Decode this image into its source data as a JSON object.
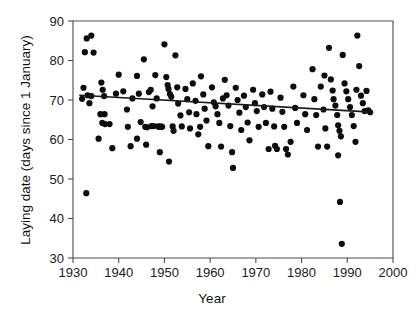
{
  "chart_data": {
    "type": "scatter",
    "title": "",
    "xlabel": "Year",
    "ylabel": "Laying date (days since 1 January)",
    "xlim": [
      1930,
      2000
    ],
    "ylim": [
      30,
      90
    ],
    "xticks": [
      1930,
      1940,
      1950,
      1960,
      1970,
      1980,
      1990,
      2000
    ],
    "xtick_labels": [
      "1930",
      "1940",
      "1950",
      "1960",
      "1970",
      "1980",
      "1990",
      "2000"
    ],
    "yticks": [
      30,
      40,
      50,
      60,
      70,
      80,
      90
    ],
    "ytick_labels": [
      "30",
      "40",
      "50",
      "60",
      "70",
      "80",
      "90"
    ],
    "grid": false,
    "legend": null,
    "marker": {
      "shape": "circle",
      "color": "#0d0d0d",
      "size": 3.1
    },
    "trend_line": {
      "type": "linear-regression",
      "color": "#1a1a1a",
      "x_start": 1931.5,
      "y_start": 71.2,
      "x_end": 1994.5,
      "y_end": 67.0
    },
    "points": [
      [
        1933.0,
        85.6
      ],
      [
        1934.0,
        86.3
      ],
      [
        1932.6,
        82.1
      ],
      [
        1934.5,
        82.0
      ],
      [
        1932.3,
        73.1
      ],
      [
        1933.2,
        71.2
      ],
      [
        1934.0,
        71.0
      ],
      [
        1932.0,
        70.3
      ],
      [
        1933.6,
        69.2
      ],
      [
        1932.9,
        46.4
      ],
      [
        1936.2,
        74.4
      ],
      [
        1936.5,
        72.6
      ],
      [
        1936.8,
        71.0
      ],
      [
        1936.0,
        66.4
      ],
      [
        1936.9,
        66.4
      ],
      [
        1936.4,
        64.2
      ],
      [
        1937.0,
        63.9
      ],
      [
        1935.6,
        60.2
      ],
      [
        1938.6,
        57.8
      ],
      [
        1939.4,
        71.6
      ],
      [
        1940.0,
        76.4
      ],
      [
        1941.8,
        67.6
      ],
      [
        1942.0,
        63.2
      ],
      [
        1942.6,
        58.3
      ],
      [
        1944.0,
        76.1
      ],
      [
        1944.4,
        71.6
      ],
      [
        1944.8,
        64.4
      ],
      [
        1944.0,
        60.2
      ],
      [
        1945.5,
        80.3
      ],
      [
        1945.8,
        63.2
      ],
      [
        1946.2,
        63.1
      ],
      [
        1946.0,
        58.7
      ],
      [
        1947.0,
        72.6
      ],
      [
        1947.4,
        68.4
      ],
      [
        1947.6,
        63.4
      ],
      [
        1947.2,
        63.4
      ],
      [
        1948.0,
        76.3
      ],
      [
        1948.3,
        70.4
      ],
      [
        1948.6,
        63.3
      ],
      [
        1948.9,
        63.2
      ],
      [
        1949.2,
        63.3
      ],
      [
        1949.5,
        63.2
      ],
      [
        1949.0,
        56.8
      ],
      [
        1950.0,
        84.1
      ],
      [
        1950.4,
        75.8
      ],
      [
        1950.7,
        73.8
      ],
      [
        1950.9,
        72.8
      ],
      [
        1951.2,
        71.5
      ],
      [
        1951.5,
        70.8
      ],
      [
        1951.8,
        63.3
      ],
      [
        1951.0,
        54.4
      ],
      [
        1952.4,
        81.3
      ],
      [
        1952.8,
        73.2
      ],
      [
        1953.0,
        69.1
      ],
      [
        1953.5,
        66.1
      ],
      [
        1953.8,
        63.3
      ],
      [
        1954.6,
        72.8
      ],
      [
        1955.0,
        70.2
      ],
      [
        1955.4,
        66.9
      ],
      [
        1955.6,
        62.8
      ],
      [
        1956.2,
        74.2
      ],
      [
        1956.8,
        69.8
      ],
      [
        1957.0,
        66.4
      ],
      [
        1957.4,
        61.3
      ],
      [
        1958.0,
        76.0
      ],
      [
        1958.5,
        71.4
      ],
      [
        1958.8,
        67.8
      ],
      [
        1959.2,
        64.8
      ],
      [
        1959.6,
        58.3
      ],
      [
        1960.4,
        73.2
      ],
      [
        1960.8,
        69.4
      ],
      [
        1961.2,
        68.4
      ],
      [
        1961.6,
        66.4
      ],
      [
        1962.0,
        64.2
      ],
      [
        1962.4,
        58.2
      ],
      [
        1963.2,
        75.1
      ],
      [
        1963.6,
        71.2
      ],
      [
        1964.0,
        68.6
      ],
      [
        1964.4,
        63.4
      ],
      [
        1964.8,
        56.8
      ],
      [
        1965.6,
        73.1
      ],
      [
        1966.0,
        70.0
      ],
      [
        1966.4,
        66.8
      ],
      [
        1966.8,
        62.4
      ],
      [
        1967.4,
        71.1
      ],
      [
        1967.8,
        68.2
      ],
      [
        1968.2,
        64.3
      ],
      [
        1968.6,
        59.8
      ],
      [
        1969.4,
        72.6
      ],
      [
        1969.8,
        69.2
      ],
      [
        1970.2,
        67.2
      ],
      [
        1970.6,
        63.2
      ],
      [
        1971.4,
        71.4
      ],
      [
        1971.8,
        68.2
      ],
      [
        1972.2,
        64.2
      ],
      [
        1973.2,
        72.1
      ],
      [
        1973.6,
        67.8
      ],
      [
        1974.0,
        63.3
      ],
      [
        1974.2,
        58.4
      ],
      [
        1974.6,
        57.6
      ],
      [
        1975.4,
        70.6
      ],
      [
        1975.8,
        67.0
      ],
      [
        1976.2,
        63.2
      ],
      [
        1976.6,
        57.6
      ],
      [
        1977.0,
        56.2
      ],
      [
        1978.2,
        73.4
      ],
      [
        1978.6,
        68.0
      ],
      [
        1979.0,
        64.2
      ],
      [
        1980.4,
        71.2
      ],
      [
        1980.8,
        66.4
      ],
      [
        1981.2,
        62.4
      ],
      [
        1982.4,
        77.8
      ],
      [
        1982.8,
        70.2
      ],
      [
        1983.2,
        66.2
      ],
      [
        1984.2,
        73.4
      ],
      [
        1984.8,
        67.6
      ],
      [
        1985.2,
        62.8
      ],
      [
        1985.6,
        58.2
      ],
      [
        1986.0,
        83.2
      ],
      [
        1986.4,
        75.2
      ],
      [
        1986.8,
        72.4
      ],
      [
        1987.0,
        70.2
      ],
      [
        1987.4,
        68.6
      ],
      [
        1987.8,
        66.2
      ],
      [
        1988.0,
        63.6
      ],
      [
        1988.3,
        62.2
      ],
      [
        1988.6,
        60.8
      ],
      [
        1988.0,
        56.0
      ],
      [
        1988.4,
        44.2
      ],
      [
        1988.8,
        33.6
      ],
      [
        1989.0,
        81.4
      ],
      [
        1989.4,
        74.2
      ],
      [
        1989.8,
        72.2
      ],
      [
        1990.2,
        70.2
      ],
      [
        1990.6,
        68.2
      ],
      [
        1991.0,
        66.2
      ],
      [
        1991.4,
        63.4
      ],
      [
        1991.8,
        59.4
      ],
      [
        1992.2,
        86.3
      ],
      [
        1992.6,
        78.6
      ],
      [
        1992.0,
        72.6
      ],
      [
        1993.0,
        71.1
      ],
      [
        1993.4,
        69.2
      ],
      [
        1993.8,
        67.2
      ],
      [
        1994.2,
        72.3
      ],
      [
        1994.6,
        67.4
      ],
      [
        1995.0,
        66.9
      ],
      [
        1938.0,
        63.9
      ],
      [
        1941.0,
        72.2
      ],
      [
        1943.0,
        70.4
      ],
      [
        1946.6,
        72.0
      ],
      [
        1952.0,
        62.2
      ],
      [
        1957.8,
        63.2
      ],
      [
        1962.8,
        70.4
      ],
      [
        1965.0,
        52.8
      ],
      [
        1972.8,
        57.6
      ],
      [
        1977.6,
        59.4
      ],
      [
        1983.6,
        58.2
      ],
      [
        1985.0,
        76.2
      ]
    ]
  }
}
